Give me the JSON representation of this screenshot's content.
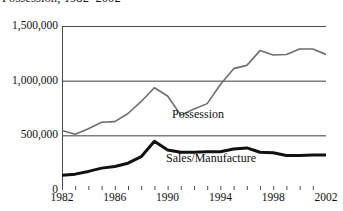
{
  "chart_data": {
    "type": "line",
    "title": "Possession, 1982–2002",
    "subtitle": "",
    "xlabel": "",
    "ylabel": "",
    "grid": "horizontal",
    "legend_position": "inline-annotation",
    "xlim": [
      1982,
      2002
    ],
    "ylim": [
      0,
      1500000
    ],
    "ytick_labels": [
      "0",
      "500,000",
      "1,000,000",
      "1,500,000"
    ],
    "ytick_values": [
      0,
      500000,
      1000000,
      1500000
    ],
    "xtick_labels": [
      "1982",
      "1986",
      "1990",
      "1994",
      "1998",
      "2002"
    ],
    "xtick_values": [
      1982,
      1986,
      1990,
      1994,
      1998,
      2002
    ],
    "x": [
      1982,
      1983,
      1984,
      1985,
      1986,
      1987,
      1988,
      1989,
      1990,
      1991,
      1992,
      1993,
      1994,
      1995,
      1996,
      1997,
      1998,
      1999,
      2000,
      2001,
      2002
    ],
    "series": [
      {
        "name": "Possession",
        "color": "#6e6e6e",
        "line_width": 1.6,
        "values": [
          545000,
          510000,
          560000,
          620000,
          625000,
          700000,
          810000,
          935000,
          860000,
          685000,
          740000,
          790000,
          965000,
          1110000,
          1140000,
          1275000,
          1235000,
          1240000,
          1290000,
          1290000,
          1240000
        ]
      },
      {
        "name": "Sales/Manufacture",
        "color": "#111111",
        "line_width": 3.0,
        "values": [
          135000,
          145000,
          170000,
          200000,
          215000,
          245000,
          305000,
          445000,
          365000,
          345000,
          345000,
          350000,
          350000,
          375000,
          385000,
          345000,
          340000,
          315000,
          315000,
          320000,
          320000
        ]
      }
    ],
    "annotations": [
      {
        "text": "Possession",
        "x": 1992.5,
        "y": 620000
      },
      {
        "text": "Sales/Manufacture",
        "x": 1992.0,
        "y": 250000
      }
    ]
  },
  "axis": {
    "frame_color": "#4a4a4a",
    "grid_color": "#3c3c3c"
  }
}
